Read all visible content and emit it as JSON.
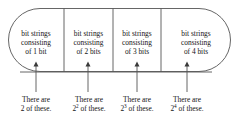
{
  "figure": {
    "type": "diagram",
    "shape": "stadium",
    "colors": {
      "background": "#ffffff",
      "stroke": "#555555",
      "text": "#141414"
    },
    "cells": [
      {
        "id": "cell-1",
        "line1": "bit strings",
        "line2": "consisting",
        "line3": "of 1 bit"
      },
      {
        "id": "cell-2",
        "line1": "bit strings",
        "line2": "consisting",
        "line3": "of 2 bits"
      },
      {
        "id": "cell-3",
        "line1": "bit strings",
        "line2": "consisting",
        "line3": "of 3 bits"
      },
      {
        "id": "cell-4",
        "line1": "bit strings",
        "line2": "consisting",
        "line3": "of 4 bits"
      }
    ],
    "captions": [
      {
        "id": "caption-1",
        "line1": "There are",
        "base": "2",
        "exponent": "",
        "tail": " of these."
      },
      {
        "id": "caption-2",
        "line1": "There are",
        "base": "2",
        "exponent": "2",
        "tail": " of these."
      },
      {
        "id": "caption-3",
        "line1": "There are",
        "base": "2",
        "exponent": "3",
        "tail": " of these."
      },
      {
        "id": "caption-4",
        "line1": "There are",
        "base": "2",
        "exponent": "4",
        "tail": " of these."
      }
    ]
  }
}
